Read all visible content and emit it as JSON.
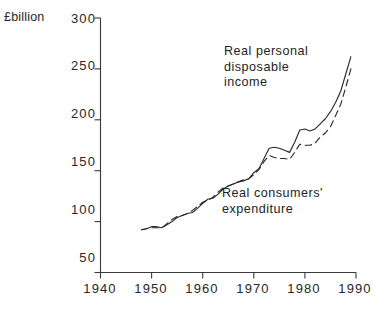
{
  "figure": {
    "unit_label": "£billion",
    "background_color": "#ffffff",
    "ink_color": "#2b2b2b"
  },
  "annotations": {
    "rpdi_note": "Real personal\ndisposable\nincome",
    "rce_note": "Real consumers'\nexpenditure"
  },
  "chart_data": {
    "type": "line",
    "title": "",
    "subtitle": "",
    "xlabel": "",
    "ylabel": "£billion",
    "xlim": [
      1940,
      1990
    ],
    "ylim": [
      50,
      300
    ],
    "xticks": [
      1940,
      1950,
      1960,
      1970,
      1980,
      1990
    ],
    "xtick_labels": [
      "1940",
      "1950",
      "1960",
      "1970",
      "1980",
      "1990"
    ],
    "yticks": [
      50,
      100,
      150,
      200,
      250,
      300
    ],
    "ytick_labels": [
      "50",
      "100",
      "150",
      "200",
      "250",
      "300"
    ],
    "grid": false,
    "legend": "inline-annotations",
    "legend_position": "in-plot",
    "axis_style": "left-and-bottom-spines-with-outward-ticks",
    "series": [
      {
        "name": "Real personal disposable income",
        "style": "solid",
        "color": "#2b2b2b",
        "x": [
          1948,
          1949,
          1950,
          1951,
          1952,
          1953,
          1954,
          1955,
          1956,
          1957,
          1958,
          1959,
          1960,
          1961,
          1962,
          1963,
          1964,
          1965,
          1966,
          1967,
          1968,
          1969,
          1970,
          1971,
          1972,
          1973,
          1974,
          1975,
          1976,
          1977,
          1978,
          1979,
          1980,
          1981,
          1982,
          1983,
          1984,
          1985,
          1986,
          1987,
          1988,
          1989
        ],
        "values": [
          92,
          93,
          95,
          95,
          94,
          97,
          100,
          104,
          106,
          108,
          109,
          113,
          118,
          122,
          123,
          127,
          132,
          135,
          137,
          139,
          140,
          142,
          148,
          152,
          162,
          172,
          173,
          172,
          170,
          168,
          178,
          190,
          191,
          189,
          191,
          196,
          201,
          208,
          217,
          228,
          245,
          262
        ]
      },
      {
        "name": "Real consumers' expenditure",
        "style": "dashed",
        "color": "#2b2b2b",
        "x": [
          1948,
          1949,
          1950,
          1951,
          1952,
          1953,
          1954,
          1955,
          1956,
          1957,
          1958,
          1959,
          1960,
          1961,
          1962,
          1963,
          1964,
          1965,
          1966,
          1967,
          1968,
          1969,
          1970,
          1971,
          1972,
          1973,
          1974,
          1975,
          1976,
          1977,
          1978,
          1979,
          1980,
          1981,
          1982,
          1983,
          1984,
          1985,
          1986,
          1987,
          1988,
          1989
        ],
        "values": [
          92,
          93,
          94,
          94,
          94,
          98,
          102,
          105,
          106,
          108,
          111,
          115,
          119,
          121,
          124,
          129,
          133,
          135,
          137,
          139,
          141,
          142,
          146,
          151,
          159,
          165,
          163,
          162,
          162,
          161,
          168,
          176,
          175,
          175,
          177,
          183,
          187,
          193,
          204,
          215,
          232,
          250
        ]
      }
    ],
    "notes": [
      "Upper solid curve is real personal disposable income",
      "Lower dashed curve is real consumers' expenditure"
    ]
  }
}
